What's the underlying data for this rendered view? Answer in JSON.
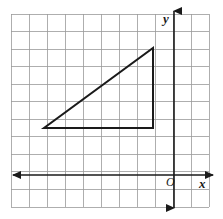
{
  "figure": {
    "width": 223,
    "height": 219,
    "background_color": "#ffffff"
  },
  "grid": {
    "line_color": "#9a9a9a",
    "line_width": 0.8,
    "cell_size_x": 18,
    "cell_size_y": 17.55,
    "columns": 11,
    "rows": 11,
    "left": 11,
    "top": 14,
    "right": 209,
    "bottom": 207,
    "visible": true
  },
  "axes": {
    "color": "#1a1a1a",
    "line_width": 1.6,
    "x_axis": {
      "name": "x-axis",
      "label": "x",
      "y_pixel": 175,
      "from_x": 13,
      "to_x": 213,
      "arrow_left": true,
      "arrow_right": true
    },
    "y_axis": {
      "name": "y-axis",
      "label": "y",
      "x_pixel": 174,
      "from_y": 11,
      "to_y": 208,
      "arrow_up": true,
      "arrow_down": true
    },
    "origin": {
      "label": "O",
      "x_pixel": 174,
      "y_pixel": 175
    }
  },
  "shape": {
    "type": "right-triangle",
    "stroke_color": "#1a1a1a",
    "stroke_width": 2,
    "fill": "none",
    "vertices_pixels": [
      {
        "name": "left-vertex",
        "x": 44,
        "y": 128
      },
      {
        "name": "right-angle-vertex",
        "x": 153,
        "y": 128
      },
      {
        "name": "top-vertex",
        "x": 153,
        "y": 48
      }
    ],
    "vertices_grid": [
      {
        "name": "left-vertex",
        "x": -7,
        "y": -3
      },
      {
        "name": "right-angle-vertex",
        "x": -1,
        "y": -3
      },
      {
        "name": "top-vertex",
        "x": -1,
        "y": 1
      }
    ],
    "base_length_units": 6,
    "height_length_units": 4
  },
  "chart_data": {
    "type": "scatter",
    "title": "",
    "xlabel": "x",
    "ylabel": "y",
    "grid": true,
    "legend": null,
    "annotations": [
      "O"
    ],
    "polygon": [
      [
        -7,
        -3
      ],
      [
        -1,
        -3
      ],
      [
        -1,
        1
      ]
    ]
  }
}
